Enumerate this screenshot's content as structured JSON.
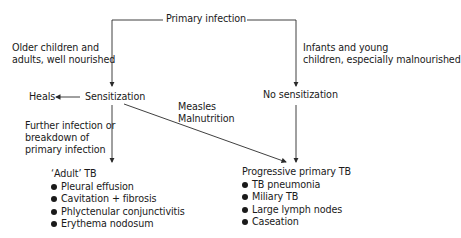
{
  "diagram": {
    "root": "Primary infection",
    "left_branch_label": [
      "Older children and",
      "adults, well nourished"
    ],
    "right_branch_label": [
      "Infants and young",
      "children, especially malnourished"
    ],
    "left_node": "Sensitization",
    "right_node": "No sensitization",
    "heals": "Heals",
    "diagonal_label": [
      "Measles",
      "Malnutrition"
    ],
    "left_down_label": [
      "Further infection or",
      "breakdown of",
      "primary infection"
    ],
    "adult_tb": {
      "title": "‘Adult’ TB",
      "items": [
        "Pleural effusion",
        "Cavitation + fibrosis",
        "Phlyctenular conjunctivitis",
        "Erythema nodosum"
      ]
    },
    "progressive_tb": {
      "title": "Progressive primary TB",
      "items": [
        "TB pneumonia",
        "Miliary TB",
        "Large lymph nodes",
        "Caseation"
      ]
    },
    "line_color": "#2a2a2a"
  }
}
